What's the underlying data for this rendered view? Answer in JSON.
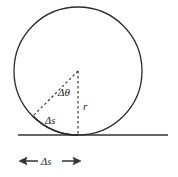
{
  "figure": {
    "labels": {
      "angle": "Δθ",
      "radius": "r",
      "arc": "Δs",
      "displacement": "Δs",
      "arrow_left": "←",
      "arrow_right": "→"
    },
    "colors": {
      "stroke": "#2b2b2b",
      "dashed_stroke": "#3a3a3a",
      "ground": "#333333",
      "background": "#ffffff",
      "text": "#1c1c1c"
    },
    "geometry": {
      "circle_center_x": 78,
      "circle_center_y": 71,
      "circle_radius": 64,
      "ground_y": 135,
      "ground_x_start": 18,
      "ground_x_end": 168,
      "contact_point_x": 78,
      "contact_point_y": 135,
      "chord_end_x": 33,
      "chord_end_y": 116,
      "arrow_y": 161,
      "arrow_x_start": 20,
      "arrow_x_end": 80
    }
  }
}
